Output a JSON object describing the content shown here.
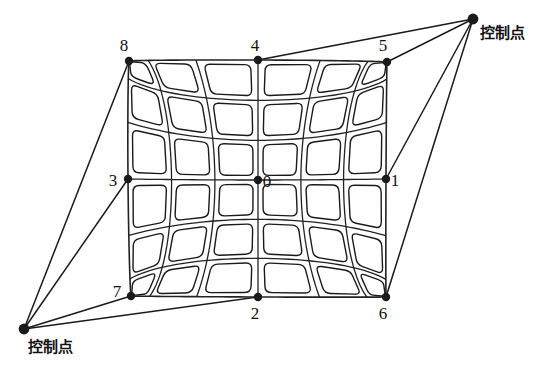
{
  "figure": {
    "background_color": "#ffffff",
    "stroke_color": "#1a1a1a",
    "grid_line_color": "#222222",
    "cell_fill": "#ffffff",
    "grid_rows": 6,
    "grid_cols": 6
  },
  "control_points": [
    {
      "id": "control-point-top-right",
      "label": "控制点",
      "x": 473,
      "y": 19,
      "label_x": 480,
      "label_y": 38,
      "connects_to": [
        "4",
        "5",
        "1",
        "6"
      ]
    },
    {
      "id": "control-point-bottom-left",
      "label": "控制点",
      "x": 24,
      "y": 329,
      "label_x": 28,
      "label_y": 352,
      "connects_to": [
        "8",
        "3",
        "7",
        "2"
      ]
    }
  ],
  "nodes": [
    {
      "id": "0",
      "label": "0",
      "x": 258,
      "y": 180,
      "label_x": 267,
      "label_y": 187
    },
    {
      "id": "1",
      "label": "1",
      "x": 386,
      "y": 179,
      "label_x": 395,
      "label_y": 186
    },
    {
      "id": "2",
      "label": "2",
      "x": 258,
      "y": 297,
      "label_x": 255,
      "label_y": 319
    },
    {
      "id": "3",
      "label": "3",
      "x": 128,
      "y": 179,
      "label_x": 113,
      "label_y": 186
    },
    {
      "id": "4",
      "label": "4",
      "x": 258,
      "y": 60,
      "label_x": 255,
      "label_y": 51
    },
    {
      "id": "5",
      "label": "5",
      "x": 387,
      "y": 62,
      "label_x": 383,
      "label_y": 51
    },
    {
      "id": "6",
      "label": "6",
      "x": 386,
      "y": 297,
      "label_x": 383,
      "label_y": 319
    },
    {
      "id": "7",
      "label": "7",
      "x": 131,
      "y": 296,
      "label_x": 117,
      "label_y": 297
    },
    {
      "id": "8",
      "label": "8",
      "x": 129,
      "y": 61,
      "label_x": 124,
      "label_y": 51
    }
  ],
  "chart_data": {
    "type": "diagram",
    "title": "",
    "mesh_corners": {
      "top_left": [
        129,
        61
      ],
      "top_right": [
        387,
        62
      ],
      "bottom_right": [
        386,
        297
      ],
      "bottom_left": [
        131,
        296
      ]
    },
    "edge_midpoints": {
      "top": [
        258,
        60
      ],
      "right": [
        386,
        179
      ],
      "bottom": [
        258,
        297
      ],
      "left": [
        128,
        179
      ]
    },
    "center": [
      258,
      180
    ],
    "cell_count": 36,
    "legend": [
      "控制点"
    ]
  }
}
